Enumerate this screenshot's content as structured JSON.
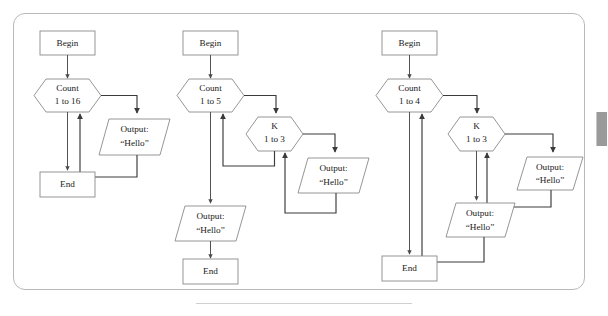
{
  "figure": {
    "type": "flowchart-set",
    "panel_border_color": "#b9b9b9",
    "shape_stroke_color": "#8a8a8a",
    "connector_color": "#3a3a3a",
    "scrollbar_color": "#9a9a9a"
  },
  "labels": {
    "begin": "Begin",
    "end": "End",
    "output_line1": "Output:",
    "output_line2": "“Hello”",
    "count": "Count",
    "k": "K",
    "range_1_to_16": "1 to 16",
    "range_1_to_5": "1 to 5",
    "range_1_to_4": "1 to 4",
    "range_1_to_3": "1 to 3"
  },
  "flowcharts": [
    {
      "id": "flowchart-1",
      "name": "single-loop-16",
      "nodes": [
        {
          "name": "begin",
          "shape": "rectangle",
          "text": "Begin"
        },
        {
          "name": "count-loop",
          "shape": "hexagon",
          "line1": "Count",
          "line2": "1 to 16"
        },
        {
          "name": "output-hello",
          "shape": "parallelogram",
          "line1": "Output:",
          "line2": "“Hello”"
        },
        {
          "name": "end",
          "shape": "rectangle",
          "text": "End"
        }
      ],
      "loop_count": 16,
      "nesting_depth": 1,
      "total_outputs": 16
    },
    {
      "id": "flowchart-2",
      "name": "nested-loop-5-by-3",
      "nodes": [
        {
          "name": "begin",
          "shape": "rectangle",
          "text": "Begin"
        },
        {
          "name": "count-loop",
          "shape": "hexagon",
          "line1": "Count",
          "line2": "1 to 5"
        },
        {
          "name": "k-loop",
          "shape": "hexagon",
          "line1": "K",
          "line2": "1 to 3"
        },
        {
          "name": "output-hello-inner",
          "shape": "parallelogram",
          "line1": "Output:",
          "line2": "“Hello”"
        },
        {
          "name": "output-hello-after",
          "shape": "parallelogram",
          "line1": "Output:",
          "line2": "“Hello”"
        },
        {
          "name": "end",
          "shape": "rectangle",
          "text": "End"
        }
      ],
      "outer_loop_count": 5,
      "inner_loop_count": 3,
      "nesting_depth": 2,
      "total_outputs": 16
    },
    {
      "id": "flowchart-3",
      "name": "nested-loop-4-by-3-plus",
      "nodes": [
        {
          "name": "begin",
          "shape": "rectangle",
          "text": "Begin"
        },
        {
          "name": "count-loop",
          "shape": "hexagon",
          "line1": "Count",
          "line2": "1 to 4"
        },
        {
          "name": "k-loop",
          "shape": "hexagon",
          "line1": "K",
          "line2": "1 to 3"
        },
        {
          "name": "output-hello-inner",
          "shape": "parallelogram",
          "line1": "Output:",
          "line2": "“Hello”"
        },
        {
          "name": "output-hello-outer",
          "shape": "parallelogram",
          "line1": "Output:",
          "line2": "“Hello”"
        },
        {
          "name": "end",
          "shape": "rectangle",
          "text": "End"
        }
      ],
      "outer_loop_count": 4,
      "inner_loop_count": 3,
      "nesting_depth": 2,
      "total_outputs": 16
    }
  ]
}
